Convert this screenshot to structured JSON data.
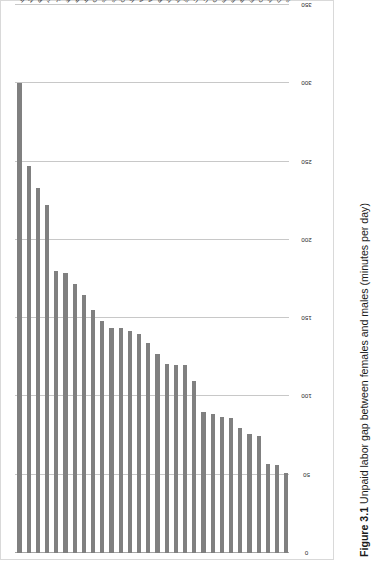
{
  "caption": {
    "number": "Figure 3.1",
    "text": "Unpaid labor gap between females and males (minutes per day)",
    "full": "Figure 3.1 Unpaid labor gap between females and males (minutes per day)"
  },
  "colors": {
    "bar": "#808080",
    "gridline": "#c8c8c8",
    "axis": "#a6a6a6",
    "text": "#2b2b2b",
    "background": "#ffffff",
    "frame": "#d9d9d9"
  },
  "chart_data": {
    "type": "bar",
    "orientation": "horizontal",
    "title": "Unpaid labor gap between females and males (minutes per day)",
    "xlabel": "",
    "ylabel": "",
    "ylim": [
      0,
      350
    ],
    "grid": true,
    "legend": false,
    "tick_labels": [
      "0",
      "50",
      "100",
      "150",
      "200",
      "250",
      "300",
      "350"
    ],
    "ticks": [
      0,
      50,
      100,
      150,
      200,
      250,
      300,
      350
    ],
    "categories": [
      "India",
      "Mexico",
      "Portugal",
      "Turkey",
      "Japan",
      "Korea",
      "Italy",
      "Ireland",
      "Greece",
      "South Africa",
      "Spain",
      "China",
      "Hungary",
      "Australia",
      "Austria",
      "Poland",
      "New Zealand",
      "Netherlands",
      "Slovenia",
      "United Kingdom",
      "United States",
      "Germany",
      "France",
      "Estonia",
      "Belgium",
      "Finland",
      "Canada",
      "Norway",
      "Denmark",
      "Sweden"
    ],
    "values": [
      300,
      247,
      233,
      222,
      180,
      179,
      172,
      165,
      155,
      148,
      144,
      144,
      142,
      140,
      134,
      127,
      121,
      120,
      120,
      110,
      90,
      89,
      87,
      86,
      80,
      76,
      75,
      57,
      56,
      51
    ]
  }
}
